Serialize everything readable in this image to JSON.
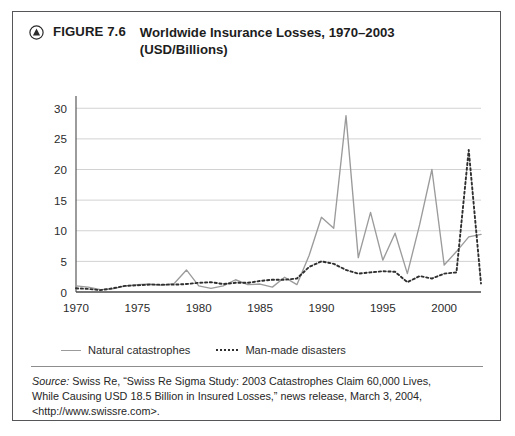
{
  "figure": {
    "badge_icon": "triangle-in-circle-icon",
    "label": "FIGURE 7.6",
    "title_line_1": "Worldwide Insurance Losses, 1970–2003",
    "title_line_2": "(USD/Billions)"
  },
  "legend": {
    "position": "below-axis-left",
    "items": [
      {
        "label": "Natural catastrophes",
        "style": "solid",
        "color": "#9b9b9b"
      },
      {
        "label": "Man-made disasters",
        "style": "dotted",
        "color": "#2f2f2f"
      }
    ]
  },
  "source": {
    "prefix": "Source:",
    "line_1": " Swiss Re, “Swiss Re Sigma Study: 2003 Catastrophes Claim 60,000 Lives,",
    "line_2": "While Causing USD 18.5 Billion in Insured Losses,” news release, March 3, 2004,",
    "line_3": "<http://www.swissre.com>."
  },
  "colors": {
    "frame": "#55565a",
    "axis": "#4a4a4a",
    "grid": "#d2d2d2",
    "natural_series": "#9b9b9b",
    "manmade_series": "#2f2f2f",
    "text": "#1d1d1d",
    "background": "#ffffff"
  },
  "chart_data": {
    "type": "line",
    "title": "Worldwide Insurance Losses, 1970–2003 (USD/Billions)",
    "xlabel": "",
    "ylabel": "",
    "xlim": [
      1970,
      2003
    ],
    "ylim": [
      0,
      32
    ],
    "yticks": [
      0,
      5,
      10,
      15,
      20,
      25,
      30
    ],
    "ytick_labels": [
      "0",
      "5",
      "10",
      "15",
      "20",
      "25",
      "30"
    ],
    "xticks": [
      1970,
      1975,
      1980,
      1985,
      1990,
      1995,
      2000
    ],
    "xtick_labels": [
      "1970",
      "1975",
      "1980",
      "1985",
      "1990",
      "1995",
      "2000"
    ],
    "grid": "horizontal",
    "legend_position": "below-plot-left",
    "x": [
      1970,
      1971,
      1972,
      1973,
      1974,
      1975,
      1976,
      1977,
      1978,
      1979,
      1980,
      1981,
      1982,
      1983,
      1984,
      1985,
      1986,
      1987,
      1988,
      1989,
      1990,
      1991,
      1992,
      1993,
      1994,
      1995,
      1996,
      1997,
      1998,
      1999,
      2000,
      2001,
      2002,
      2003
    ],
    "series": [
      {
        "name": "Natural catastrophes",
        "style": "solid",
        "color": "#9b9b9b",
        "values": [
          1.0,
          0.8,
          0.4,
          0.5,
          1.0,
          1.2,
          1.3,
          1.1,
          1.4,
          3.6,
          1.0,
          0.6,
          1.0,
          2.0,
          1.2,
          1.3,
          0.8,
          2.4,
          1.2,
          6.0,
          12.2,
          10.4,
          28.8,
          5.6,
          13.0,
          5.2,
          9.6,
          3.0,
          11.0,
          20.0,
          4.4,
          6.6,
          9.0,
          9.4
        ]
      },
      {
        "name": "Man-made disasters",
        "style": "dotted",
        "color": "#2f2f2f",
        "values": [
          0.6,
          0.5,
          0.3,
          0.6,
          1.0,
          1.1,
          1.2,
          1.2,
          1.2,
          1.3,
          1.5,
          1.6,
          1.3,
          1.5,
          1.5,
          1.8,
          2.0,
          2.0,
          2.2,
          4.1,
          5.0,
          4.6,
          3.6,
          3.0,
          3.2,
          3.4,
          3.3,
          1.6,
          2.6,
          2.2,
          3.0,
          3.2,
          23.2,
          1.4
        ]
      }
    ]
  }
}
